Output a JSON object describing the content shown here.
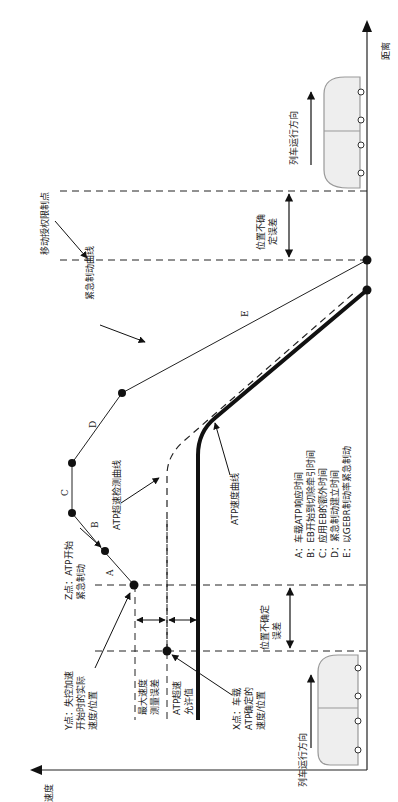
{
  "axes": {
    "speed_label": "速度",
    "distance_label": "距离"
  },
  "labels": {
    "y_point": [
      "Y点：失控加速",
      "开始时的实际",
      "速度/位置"
    ],
    "x_point": [
      "X点：车载",
      "ATP确定的",
      "速度/位置"
    ],
    "z_point": [
      "Z点：ATP开始",
      "紧急制动"
    ],
    "max_speed_error": [
      "最大速度",
      "测量误差"
    ],
    "atp_overspeed_allow": [
      "ATP超速",
      "允许值"
    ],
    "position_uncertainty_left": [
      "位置不确定",
      "误差"
    ],
    "position_uncertainty_right": [
      "位置不确",
      "定误差"
    ],
    "overspeed_curve": "ATP超速检测曲线",
    "speed_curve": "ATP速度曲线",
    "emergency_curve": "紧急制动曲线",
    "ma_limit": "移动授权限制点",
    "train_direction_left": "列车运行方向",
    "train_direction_right": "列车运行方向",
    "segment_A": "A",
    "segment_B": "B",
    "segment_C": "C",
    "segment_D": "D",
    "segment_E": "E"
  },
  "legend": [
    "A：车载ATP响应时间",
    "B：EB开始到切除牵引时间",
    "C：应用EB的额外时间",
    "D：紧急制动建立时间",
    "E：以GEBR制动率紧急制动"
  ]
}
